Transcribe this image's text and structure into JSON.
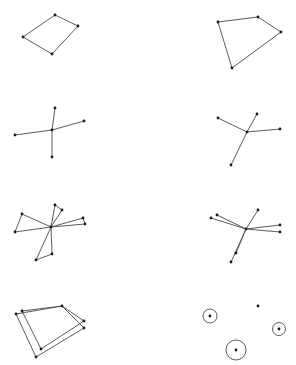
{
  "colors": {
    "background": "#ffffff",
    "edge": "#4a4a4a",
    "node": "#1a1a1a"
  },
  "panels": [
    {
      "id": "quad-left",
      "nodes": [
        [
          55,
          15
        ],
        [
          78,
          26
        ],
        [
          52,
          54
        ],
        [
          23,
          37
        ]
      ],
      "edges": [
        [
          0,
          1
        ],
        [
          1,
          2
        ],
        [
          2,
          3
        ],
        [
          3,
          0
        ]
      ]
    },
    {
      "id": "quad-right",
      "nodes": [
        [
          218,
          22
        ],
        [
          258,
          17
        ],
        [
          281,
          32
        ],
        [
          232,
          68
        ]
      ],
      "edges": [
        [
          0,
          1
        ],
        [
          1,
          2
        ],
        [
          2,
          3
        ],
        [
          3,
          0
        ]
      ]
    },
    {
      "id": "star-left",
      "nodes": [
        [
          52,
          130
        ],
        [
          55,
          108
        ],
        [
          84,
          121
        ],
        [
          15,
          135
        ],
        [
          52,
          157
        ]
      ],
      "edges": [
        [
          0,
          1
        ],
        [
          0,
          2
        ],
        [
          0,
          3
        ],
        [
          0,
          4
        ]
      ]
    },
    {
      "id": "star-right",
      "nodes": [
        [
          247,
          132
        ],
        [
          218,
          118
        ],
        [
          257,
          114
        ],
        [
          280,
          129
        ],
        [
          231,
          165
        ]
      ],
      "edges": [
        [
          0,
          1
        ],
        [
          0,
          2
        ],
        [
          0,
          3
        ],
        [
          0,
          4
        ]
      ]
    },
    {
      "id": "pinwheel-left",
      "nodes": [
        [
          51,
          227
        ],
        [
          22,
          214
        ],
        [
          15,
          232
        ],
        [
          55,
          205
        ],
        [
          62,
          210
        ],
        [
          83,
          218
        ],
        [
          85,
          224
        ],
        [
          52,
          254
        ],
        [
          36,
          260
        ]
      ],
      "edges": [
        [
          0,
          1
        ],
        [
          1,
          2
        ],
        [
          2,
          0
        ],
        [
          0,
          3
        ],
        [
          3,
          4
        ],
        [
          4,
          0
        ],
        [
          0,
          5
        ],
        [
          5,
          6
        ],
        [
          6,
          0
        ],
        [
          0,
          7
        ],
        [
          7,
          8
        ],
        [
          8,
          0
        ]
      ]
    },
    {
      "id": "pinwheel-right",
      "nodes": [
        [
          246,
          229
        ],
        [
          217,
          215
        ],
        [
          211,
          218
        ],
        [
          258,
          210
        ],
        [
          280,
          225
        ],
        [
          280,
          232
        ],
        [
          236,
          253
        ],
        [
          231,
          262
        ]
      ],
      "edges": [
        [
          0,
          1
        ],
        [
          0,
          2
        ],
        [
          0,
          3
        ],
        [
          0,
          4
        ],
        [
          0,
          5
        ],
        [
          0,
          6
        ],
        [
          0,
          7
        ]
      ]
    },
    {
      "id": "double-quad",
      "nodes": [
        [
          22,
          311
        ],
        [
          16,
          314
        ],
        [
          62,
          306
        ],
        [
          84,
          321
        ],
        [
          84,
          328
        ],
        [
          41,
          349
        ],
        [
          36,
          357
        ]
      ],
      "edges": [
        [
          0,
          2
        ],
        [
          1,
          2
        ],
        [
          2,
          3
        ],
        [
          2,
          4
        ],
        [
          3,
          5
        ],
        [
          4,
          6
        ],
        [
          5,
          0
        ],
        [
          6,
          1
        ]
      ]
    },
    {
      "id": "circles",
      "nodes": [
        [
          210,
          316
        ],
        [
          258,
          306
        ],
        [
          279,
          329
        ],
        [
          236,
          350
        ]
      ],
      "rings": [
        [
          210,
          316,
          7
        ],
        [
          279,
          329,
          6.5
        ],
        [
          236,
          350,
          10
        ]
      ]
    }
  ]
}
